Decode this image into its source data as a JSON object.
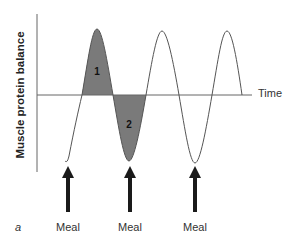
{
  "diagram": {
    "y_axis_label": "Muscle protein balance",
    "x_axis_label": "Time",
    "panel_label": "a",
    "regions": [
      {
        "id": "1",
        "label": "1",
        "description": "positive balance area (above time axis)"
      },
      {
        "id": "2",
        "label": "2",
        "description": "negative balance area (below time axis)"
      }
    ],
    "meals": [
      {
        "label": "Meal",
        "x": 68
      },
      {
        "label": "Meal",
        "x": 130
      },
      {
        "label": "Meal",
        "x": 195
      }
    ],
    "colors": {
      "shade": "#7a7a7a",
      "line": "#555555",
      "arrow": "#1a1a1a",
      "axis": "#555555"
    }
  }
}
